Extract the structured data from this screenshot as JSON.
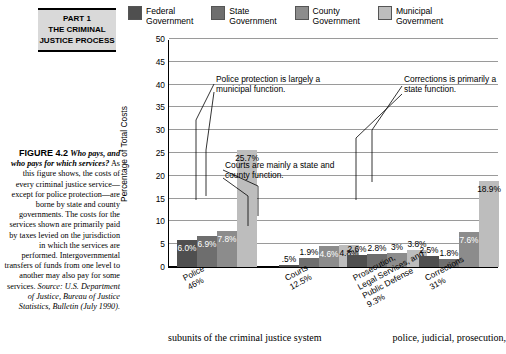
{
  "part_banner": {
    "line1": "PART 1",
    "line2": "THE CRIMINAL",
    "line3": "JUSTICE PROCESS"
  },
  "figure_caption": {
    "figure_number": "FIGURE 4.2",
    "question": "Who pays, and who pays for which services?",
    "body": "As this figure shows, the costs of every criminal justice service—except for police protection—are borne by state and county governments. The costs for the services shown are primarily paid by taxes levied on the jurisdiction in which the services are performed. Intergovernmental transfers of funds from one level to another may also pay for some services.",
    "source": "Source: U.S. Department of Justice, Bureau of Justice Statistics, Bulletin (July 1990)."
  },
  "chart_data": {
    "type": "bar",
    "title": "",
    "xlabel": "",
    "ylabel": "Percentage of Total Costs",
    "ylim": [
      0,
      50
    ],
    "yticks": [
      0,
      5,
      10,
      15,
      20,
      25,
      30,
      35,
      40,
      45,
      50
    ],
    "grid": true,
    "legend_position": "top",
    "categories": [
      {
        "label": "Police",
        "pct": "46%"
      },
      {
        "label": "Courts",
        "pct": "12.5%"
      },
      {
        "label": "Prosecution,\nLegal Services, and\nPublic Defense",
        "pct": "9.3%"
      },
      {
        "label": "Corrections",
        "pct": "31%"
      }
    ],
    "series": [
      {
        "name": "Federal Government",
        "color": "#4f4f4f",
        "values": [
          6.0,
          0.5,
          2.6,
          2.5
        ],
        "labels": [
          "6.0%",
          ".5%",
          "2.6%",
          "2.5%"
        ]
      },
      {
        "name": "State Government",
        "color": "#6e6e6e",
        "values": [
          6.9,
          1.9,
          2.8,
          1.8
        ],
        "labels": [
          "6.9%",
          "1.9%",
          "2.8%",
          "1.8%"
        ]
      },
      {
        "name": "County Government",
        "color": "#8c8c8c",
        "values": [
          7.8,
          4.6,
          3.0,
          7.6
        ],
        "labels": [
          "7.8%",
          "4.6%",
          "3%",
          "7.6%"
        ]
      },
      {
        "name": "Municipal Government",
        "color": "#bdbdbd",
        "values": [
          25.7,
          4.8,
          3.8,
          18.9
        ],
        "labels": [
          "25.7%",
          "4.8%",
          "3.8%",
          "18.9%"
        ]
      }
    ]
  },
  "legend": [
    {
      "name": "legend-federal",
      "line1": "Federal",
      "line2": "Government",
      "color": "#4f4f4f"
    },
    {
      "name": "legend-state",
      "line1": "State",
      "line2": "Government",
      "color": "#6e6e6e"
    },
    {
      "name": "legend-county",
      "line1": "County",
      "line2": "Government",
      "color": "#8c8c8c"
    },
    {
      "name": "legend-municipal",
      "line1": "Municipal",
      "line2": "Government",
      "color": "#bdbdbd"
    }
  ],
  "annotations": [
    {
      "name": "annotation-police",
      "text": "Police protection is largely a municipal function."
    },
    {
      "name": "annotation-corrections",
      "text": "Corrections is primarily a state function."
    },
    {
      "name": "annotation-courts",
      "text": "Courts are mainly a state and county function."
    }
  ],
  "bottom_text": {
    "left": "subunits of the criminal justice system",
    "right": "police, judicial, prosecution,"
  }
}
